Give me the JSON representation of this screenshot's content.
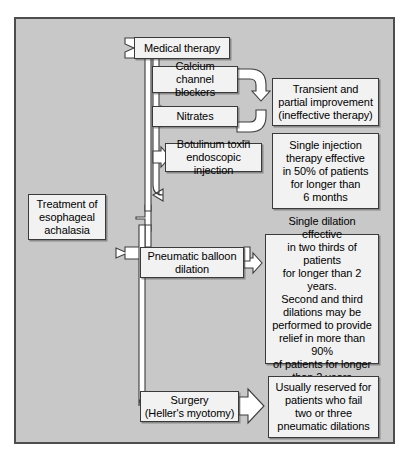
{
  "figure": {
    "kind": "flowchart",
    "orientation": "left-to-right",
    "background_color": "#c8c8c8",
    "frame_border_color": "#4d4d4d",
    "node_fill_color": "#f2f2f2",
    "node_border_color": "#3a3a3a",
    "arrow_fill_color": "#ffffff",
    "arrow_stroke_color": "#3d3d3d"
  },
  "nodes": {
    "root": {
      "id": "root",
      "lines": [
        "Treatment of",
        "esophageal",
        "achalasia"
      ],
      "text": "Treatment of esophageal achalasia"
    },
    "medical_therapy": {
      "id": "medical-therapy",
      "lines": [
        "Medical therapy"
      ],
      "text": "Medical therapy"
    },
    "calcium_channel_blockers": {
      "id": "calcium-channel-blockers",
      "lines": [
        "Calcium channel",
        "blockers"
      ],
      "text": "Calcium channel blockers"
    },
    "nitrates": {
      "id": "nitrates",
      "lines": [
        "Nitrates"
      ],
      "text": "Nitrates"
    },
    "transient_improvement": {
      "id": "transient-improvement",
      "lines": [
        "Transient and",
        "partial improvement",
        "(ineffective therapy)"
      ],
      "text": "Transient and partial improvement (ineffective therapy)"
    },
    "botulinum_toxin": {
      "id": "botulinum-toxin",
      "lines": [
        "Botulinum toxin",
        "endoscopic injection"
      ],
      "text": "Botulinum toxin endoscopic injection"
    },
    "botulinum_outcome": {
      "id": "botulinum-outcome",
      "lines": [
        "Single injection",
        "therapy effective",
        "in 50% of patients",
        "for longer than",
        "6 months"
      ],
      "text": "Single injection therapy effective in 50% of patients for longer than 6 months"
    },
    "pneumatic_balloon": {
      "id": "pneumatic-balloon-dilation",
      "lines": [
        "Pneumatic balloon",
        "dilation"
      ],
      "text": "Pneumatic balloon dilation"
    },
    "pneumatic_outcome": {
      "id": "pneumatic-outcome",
      "lines": [
        "Single dilation effective",
        "in two thirds of patients",
        "for longer than 2 years.",
        "Second and third",
        "dilations may be",
        "performed to provide",
        "relief in more than 90%",
        "of patients for longer",
        "than 2 years"
      ],
      "text": "Single dilation effective in two thirds of patients for longer than 2 years. Second and third dilations may be performed to provide relief in more than 90% of patients for longer than 2 years"
    },
    "surgery": {
      "id": "surgery",
      "lines": [
        "Surgery",
        "(Heller's myotomy)"
      ],
      "text": "Surgery (Heller's myotomy)"
    },
    "surgery_outcome": {
      "id": "surgery-outcome",
      "lines": [
        "Usually reserved for",
        "patients who fail",
        "two or three",
        "pneumatic dilations"
      ],
      "text": "Usually reserved for patients who fail two or three pneumatic dilations"
    }
  },
  "edges": [
    {
      "from": "root",
      "to": "medical_therapy",
      "arrow": true
    },
    {
      "from": "root",
      "to": "pneumatic_balloon",
      "arrow": true
    },
    {
      "from": "root",
      "to": "surgery",
      "arrow": true
    },
    {
      "from": "medical_therapy",
      "to": "calcium_channel_blockers",
      "arrow": true
    },
    {
      "from": "medical_therapy",
      "to": "nitrates",
      "arrow": true
    },
    {
      "from": "medical_therapy",
      "to": "botulinum_toxin",
      "arrow": true
    },
    {
      "from": "calcium_channel_blockers",
      "to": "transient_improvement",
      "arrow": true
    },
    {
      "from": "nitrates",
      "to": "transient_improvement",
      "arrow": true
    },
    {
      "from": "botulinum_toxin",
      "to": "botulinum_outcome",
      "arrow": true
    },
    {
      "from": "pneumatic_balloon",
      "to": "pneumatic_outcome",
      "arrow": true
    },
    {
      "from": "surgery",
      "to": "surgery_outcome",
      "arrow": true
    }
  ]
}
